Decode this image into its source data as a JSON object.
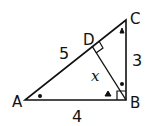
{
  "diagram": {
    "type": "right-triangle-with-altitude",
    "vertices": {
      "A": {
        "label": "A"
      },
      "B": {
        "label": "B"
      },
      "C": {
        "label": "C"
      },
      "D": {
        "label": "D"
      }
    },
    "side_labels": {
      "AC": "5",
      "BC": "3",
      "AB": "4",
      "BD": "x"
    },
    "right_angles": [
      "B",
      "D"
    ],
    "angle_marks": {
      "dot": [
        "A",
        "DBC"
      ],
      "triangle": [
        "C",
        "ABD"
      ]
    },
    "colors": {
      "stroke": "#111111",
      "background": "#ffffff"
    }
  }
}
